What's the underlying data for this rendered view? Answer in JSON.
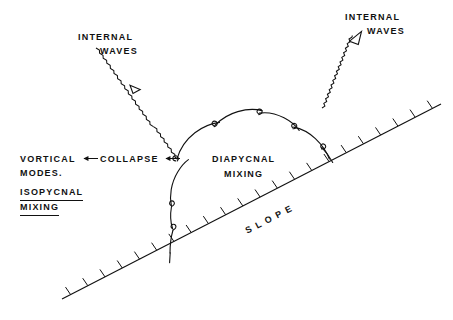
{
  "figure": {
    "name": "turbulent-boundary-mixing-schematic",
    "background_color": "#ffffff",
    "ink_color": "#111111",
    "width": 453,
    "height": 320
  },
  "labels": {
    "internal_waves_left": {
      "line1": "INTERNAL",
      "line2": "WAVES"
    },
    "internal_waves_right": {
      "line1": "INTERNAL",
      "line2": "WAVES"
    },
    "diapycnal_mixing": {
      "line1": "DIAPYCNAL",
      "line2": "MIXING"
    },
    "vortical": "VORTICAL",
    "collapse": "COLLAPSE",
    "modes": "MODES.",
    "isopycnal": "ISOPYCNAL",
    "mixing": "MIXING",
    "slope": "SLOPE"
  },
  "icons": {
    "wave_arrow_left": "zigzag-arrow-down-right-icon",
    "wave_arrow_right": "zigzag-arrow-up-right-icon",
    "collapse_arrow_1": "arrow-left-icon",
    "collapse_arrow_2": "arrow-left-icon",
    "slope_hatching": "hatched-boundary-icon",
    "billow_chain": "breaking-billow-curl-icon"
  },
  "geometry": {
    "slope_line": {
      "x1": 62,
      "y1": 299,
      "x2": 441,
      "y2": 104
    },
    "slope_hatch_count": 22,
    "slope_hatch_length": 9,
    "wave_left": {
      "x1": 96,
      "y1": 48,
      "x2": 196,
      "y2": 127
    },
    "wave_right": {
      "x1": 322,
      "y1": 108,
      "x2": 369,
      "y2": 32
    },
    "billow_curl_count": 7
  }
}
